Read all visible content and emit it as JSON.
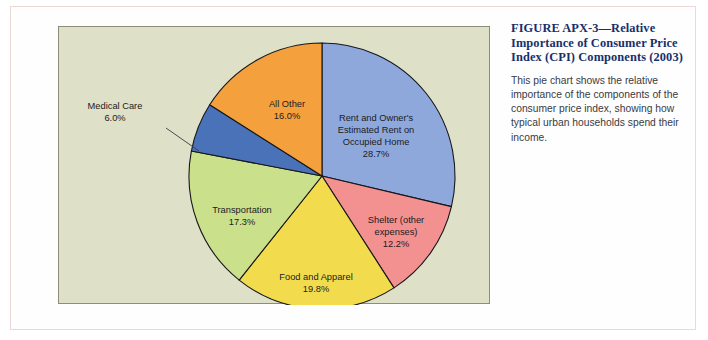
{
  "figure": {
    "title": "FIGURE APX-3—Relative Importance of Consumer Price Index (CPI) Components (2003)",
    "body": "This pie chart shows the relative importance of the components of the consumer price index, showing how typical urban households spend their income."
  },
  "colors": {
    "page_background": "#ffffff",
    "figure_border": "#ecd9d7",
    "panel_background": "#dfe0c8",
    "panel_border": "#8d8d7a",
    "slice_outline": "#17171c",
    "label_text": "#1b1b22",
    "title_text": "#16306b",
    "body_text": "#3a3a42",
    "callout_line": "#3b3b4a"
  },
  "chart_data": {
    "type": "pie",
    "title": "Relative Importance of Consumer Price Index (CPI) Components (2003)",
    "xlabel": "",
    "ylabel": "",
    "units": "percent",
    "total": 100.0,
    "legend": "none",
    "labels_position": "inside-slices",
    "start_angle_deg": 0,
    "direction": "clockwise",
    "categories": [
      "Rent and Owner's Estimated Rent on Occupied Home",
      "Shelter (other expenses)",
      "Food and Apparel",
      "Transportation",
      "Medical Care",
      "All Other"
    ],
    "values": [
      28.7,
      12.2,
      19.8,
      17.3,
      6.0,
      16.0
    ],
    "slices": [
      {
        "name": "Rent and Owner's Estimated Rent on Occupied Home",
        "value": 28.7,
        "value_label": "28.7%",
        "color": "#8fa8dc",
        "label_lines": [
          "Rent and Owner's",
          "Estimated Rent on",
          "Occupied Home",
          "28.7%"
        ],
        "label_placement": "inside"
      },
      {
        "name": "Shelter (other expenses)",
        "value": 12.2,
        "value_label": "12.2%",
        "color": "#f2918f",
        "label_lines": [
          "Shelter (other",
          "expenses)",
          "12.2%"
        ],
        "label_placement": "inside"
      },
      {
        "name": "Food and Apparel",
        "value": 19.8,
        "value_label": "19.8%",
        "color": "#f2dc4e",
        "label_lines": [
          "Food and Apparel",
          "19.8%"
        ],
        "label_placement": "inside"
      },
      {
        "name": "Transportation",
        "value": 17.3,
        "value_label": "17.3%",
        "color": "#cbe08a",
        "label_lines": [
          "Transportation",
          "17.3%"
        ],
        "label_placement": "inside"
      },
      {
        "name": "Medical Care",
        "value": 6.0,
        "value_label": "6.0%",
        "color": "#4a72b8",
        "label_lines": [
          "Medical Care",
          "6.0%"
        ],
        "label_placement": "outside-left-callout"
      },
      {
        "name": "All Other",
        "value": 16.0,
        "value_label": "16.0%",
        "color": "#f4a03c",
        "label_lines": [
          "All Other",
          "16.0%"
        ],
        "label_placement": "inside"
      }
    ]
  }
}
